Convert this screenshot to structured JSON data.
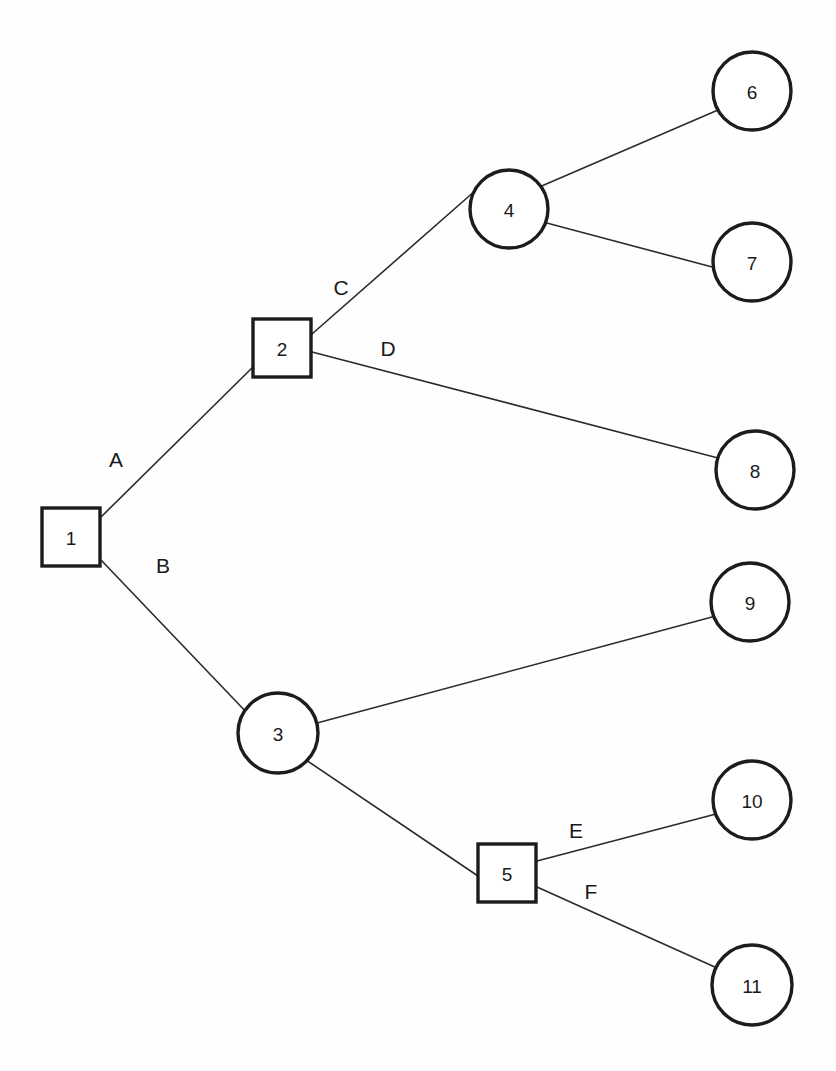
{
  "diagram": {
    "type": "decision-tree",
    "canvas": {
      "width": 836,
      "height": 1071
    },
    "background_color": "#fefefe",
    "stroke_color": "#1c1c1c",
    "edge_color": "#2b2b2b",
    "node_fill": "#ffffff",
    "nodes": [
      {
        "id": "1",
        "label": "1",
        "shape": "square",
        "x": 71,
        "y": 537,
        "size": 58
      },
      {
        "id": "2",
        "label": "2",
        "shape": "square",
        "x": 282,
        "y": 348,
        "size": 58
      },
      {
        "id": "3",
        "label": "3",
        "shape": "circle",
        "x": 278,
        "y": 733,
        "r": 40
      },
      {
        "id": "4",
        "label": "4",
        "shape": "circle",
        "x": 509,
        "y": 209,
        "r": 39
      },
      {
        "id": "5",
        "label": "5",
        "shape": "square",
        "x": 507,
        "y": 873,
        "size": 58
      },
      {
        "id": "6",
        "label": "6",
        "shape": "circle",
        "x": 752,
        "y": 91,
        "r": 39
      },
      {
        "id": "7",
        "label": "7",
        "shape": "circle",
        "x": 752,
        "y": 262,
        "r": 39
      },
      {
        "id": "8",
        "label": "8",
        "shape": "circle",
        "x": 755,
        "y": 470,
        "r": 39
      },
      {
        "id": "9",
        "label": "9",
        "shape": "circle",
        "x": 750,
        "y": 602,
        "r": 39
      },
      {
        "id": "10",
        "label": "10",
        "shape": "circle",
        "x": 752,
        "y": 800,
        "r": 39
      },
      {
        "id": "11",
        "label": "11",
        "shape": "circle",
        "x": 752,
        "y": 985,
        "r": 40
      }
    ],
    "edges": [
      {
        "id": "e-a",
        "from": "1",
        "to": "2",
        "label": "A",
        "x1": 101,
        "y1": 517,
        "x2": 254,
        "y2": 366,
        "lx": 116,
        "ly": 459
      },
      {
        "id": "e-b",
        "from": "1",
        "to": "3",
        "label": "B",
        "x1": 101,
        "y1": 560,
        "x2": 250,
        "y2": 716,
        "lx": 163,
        "ly": 565
      },
      {
        "id": "e-c",
        "from": "2",
        "to": "4",
        "label": "C",
        "x1": 312,
        "y1": 334,
        "x2": 476,
        "y2": 190,
        "lx": 341,
        "ly": 287
      },
      {
        "id": "e-d",
        "from": "2",
        "to": "8",
        "label": "D",
        "x1": 312,
        "y1": 352,
        "x2": 718,
        "y2": 458,
        "lx": 388,
        "ly": 348
      },
      {
        "id": "e-46",
        "from": "4",
        "to": "6",
        "label": "",
        "x1": 537,
        "y1": 188,
        "x2": 718,
        "y2": 110,
        "lx": 0,
        "ly": 0
      },
      {
        "id": "e-47",
        "from": "4",
        "to": "7",
        "label": "",
        "x1": 543,
        "y1": 222,
        "x2": 716,
        "y2": 268,
        "lx": 0,
        "ly": 0
      },
      {
        "id": "e-39",
        "from": "3",
        "to": "9",
        "label": "",
        "x1": 317,
        "y1": 723,
        "x2": 712,
        "y2": 617,
        "lx": 0,
        "ly": 0
      },
      {
        "id": "e-35",
        "from": "3",
        "to": "5",
        "label": "",
        "x1": 306,
        "y1": 760,
        "x2": 478,
        "y2": 876,
        "lx": 0,
        "ly": 0
      },
      {
        "id": "e-e",
        "from": "5",
        "to": "10",
        "label": "E",
        "x1": 537,
        "y1": 861,
        "x2": 716,
        "y2": 814,
        "lx": 576,
        "ly": 830
      },
      {
        "id": "e-f",
        "from": "5",
        "to": "11",
        "label": "F",
        "x1": 537,
        "y1": 887,
        "x2": 717,
        "y2": 968,
        "lx": 591,
        "ly": 891
      }
    ]
  }
}
